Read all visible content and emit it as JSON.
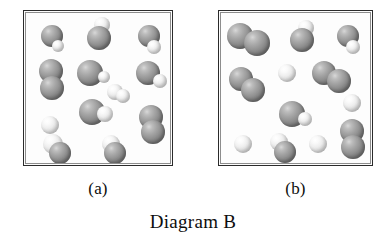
{
  "figure": {
    "caption": "Diagram B",
    "width": 386,
    "height": 248,
    "background_color": "#ffffff"
  },
  "legend": {
    "dark_atom_color": "#8f8f8f",
    "light_atom_color": "#ececec",
    "border_color": "#2b2b2b"
  },
  "panels": [
    {
      "id": "a",
      "label": "(a)",
      "box": {
        "x": 23,
        "y": 10,
        "width": 150,
        "height": 156
      },
      "molecule_count": 13,
      "molecules": [
        {
          "name": "dark-light-pair",
          "x": 28,
          "y": 28,
          "atoms": [
            {
              "type": "dark",
              "cx": 0,
              "cy": -3,
              "r": 11
            },
            {
              "type": "light",
              "cx": 6,
              "cy": 7,
              "r": 6
            }
          ]
        },
        {
          "name": "light-dark-pair",
          "x": 76,
          "y": 22,
          "atoms": [
            {
              "type": "light",
              "cx": 2,
              "cy": -8,
              "r": 8
            },
            {
              "type": "dark",
              "cx": -1,
              "cy": 5,
              "r": 12
            }
          ]
        },
        {
          "name": "dark-light-pair",
          "x": 125,
          "y": 28,
          "atoms": [
            {
              "type": "dark",
              "cx": 0,
              "cy": -3,
              "r": 11
            },
            {
              "type": "light",
              "cx": 5,
              "cy": 8,
              "r": 7
            }
          ]
        },
        {
          "name": "dark-dark-pair",
          "x": 27,
          "y": 68,
          "atoms": [
            {
              "type": "dark",
              "cx": 0,
              "cy": -8,
              "r": 12
            },
            {
              "type": "dark",
              "cx": 1,
              "cy": 9,
              "r": 12
            }
          ]
        },
        {
          "name": "dark-light-pair",
          "x": 68,
          "y": 62,
          "atoms": [
            {
              "type": "dark",
              "cx": -2,
              "cy": 0,
              "r": 13
            },
            {
              "type": "light",
              "cx": 12,
              "cy": 4,
              "r": 6
            }
          ]
        },
        {
          "name": "dark-light-pair",
          "x": 126,
          "y": 64,
          "atoms": [
            {
              "type": "dark",
              "cx": -2,
              "cy": -2,
              "r": 12
            },
            {
              "type": "light",
              "cx": 10,
              "cy": 6,
              "r": 7
            }
          ]
        },
        {
          "name": "light-light-pair",
          "x": 94,
          "y": 82,
          "atoms": [
            {
              "type": "light",
              "cx": -3,
              "cy": -1,
              "r": 8
            },
            {
              "type": "light",
              "cx": 5,
              "cy": 3,
              "r": 7
            }
          ]
        },
        {
          "name": "dark-light-pair",
          "x": 71,
          "y": 101,
          "atoms": [
            {
              "type": "dark",
              "cx": -3,
              "cy": 0,
              "r": 13
            },
            {
              "type": "light",
              "cx": 10,
              "cy": 2,
              "r": 8
            }
          ]
        },
        {
          "name": "light-atom",
          "x": 26,
          "y": 114,
          "atoms": [
            {
              "type": "light",
              "cx": 0,
              "cy": 0,
              "r": 9
            }
          ]
        },
        {
          "name": "dark-dark-pair",
          "x": 127,
          "y": 113,
          "atoms": [
            {
              "type": "dark",
              "cx": 0,
              "cy": -7,
              "r": 12
            },
            {
              "type": "dark",
              "cx": 2,
              "cy": 8,
              "r": 12
            }
          ]
        },
        {
          "name": "light-dark-pair",
          "x": 31,
          "y": 137,
          "atoms": [
            {
              "type": "light",
              "cx": -2,
              "cy": -4,
              "r": 10
            },
            {
              "type": "dark",
              "cx": 5,
              "cy": 5,
              "r": 11
            }
          ]
        },
        {
          "name": "light-dark-pair",
          "x": 88,
          "y": 137,
          "atoms": [
            {
              "type": "light",
              "cx": -1,
              "cy": -4,
              "r": 9
            },
            {
              "type": "dark",
              "cx": 3,
              "cy": 5,
              "r": 11
            }
          ]
        }
      ]
    },
    {
      "id": "b",
      "label": "(b)",
      "box": {
        "x": 218,
        "y": 10,
        "width": 155,
        "height": 156
      },
      "molecule_count": 12,
      "molecules": [
        {
          "name": "dark-dark-pair",
          "x": 30,
          "y": 28,
          "atoms": [
            {
              "type": "dark",
              "cx": -9,
              "cy": -3,
              "r": 13
            },
            {
              "type": "dark",
              "cx": 8,
              "cy": 4,
              "r": 13
            }
          ]
        },
        {
          "name": "light-dark-pair",
          "x": 84,
          "y": 26,
          "atoms": [
            {
              "type": "light",
              "cx": 3,
              "cy": -9,
              "r": 8
            },
            {
              "type": "dark",
              "cx": -1,
              "cy": 3,
              "r": 12
            }
          ]
        },
        {
          "name": "dark-light-pair",
          "x": 128,
          "y": 28,
          "atoms": [
            {
              "type": "dark",
              "cx": 1,
              "cy": -3,
              "r": 11
            },
            {
              "type": "light",
              "cx": 6,
              "cy": 8,
              "r": 7
            }
          ]
        },
        {
          "name": "light-atom",
          "x": 68,
          "y": 62,
          "atoms": [
            {
              "type": "light",
              "cx": 0,
              "cy": 0,
              "r": 9
            }
          ]
        },
        {
          "name": "dark-dark-pair",
          "x": 113,
          "y": 66,
          "atoms": [
            {
              "type": "dark",
              "cx": -8,
              "cy": -4,
              "r": 12
            },
            {
              "type": "dark",
              "cx": 7,
              "cy": 4,
              "r": 12
            }
          ]
        },
        {
          "name": "dark-dark-pair",
          "x": 28,
          "y": 74,
          "atoms": [
            {
              "type": "dark",
              "cx": -6,
              "cy": -6,
              "r": 12
            },
            {
              "type": "dark",
              "cx": 6,
              "cy": 5,
              "r": 12
            }
          ]
        },
        {
          "name": "light-atom",
          "x": 133,
          "y": 92,
          "atoms": [
            {
              "type": "light",
              "cx": 0,
              "cy": 0,
              "r": 9
            }
          ]
        },
        {
          "name": "dark-light-pair",
          "x": 76,
          "y": 104,
          "atoms": [
            {
              "type": "dark",
              "cx": -3,
              "cy": -1,
              "r": 13
            },
            {
              "type": "light",
              "cx": 10,
              "cy": 4,
              "r": 7
            }
          ]
        },
        {
          "name": "light-atom",
          "x": 24,
          "y": 133,
          "atoms": [
            {
              "type": "light",
              "cx": 0,
              "cy": 0,
              "r": 9
            }
          ]
        },
        {
          "name": "light-dark-pair",
          "x": 62,
          "y": 136,
          "atoms": [
            {
              "type": "light",
              "cx": -2,
              "cy": -5,
              "r": 9
            },
            {
              "type": "dark",
              "cx": 4,
              "cy": 5,
              "r": 11
            }
          ]
        },
        {
          "name": "light-atom",
          "x": 99,
          "y": 133,
          "atoms": [
            {
              "type": "light",
              "cx": 0,
              "cy": 0,
              "r": 9
            }
          ]
        },
        {
          "name": "dark-dark-pair",
          "x": 133,
          "y": 128,
          "atoms": [
            {
              "type": "dark",
              "cx": 0,
              "cy": -8,
              "r": 12
            },
            {
              "type": "dark",
              "cx": 1,
              "cy": 8,
              "r": 12
            }
          ]
        }
      ]
    }
  ],
  "chart_data": {
    "type": "diagram",
    "title": "Diagram B",
    "panels": [
      {
        "label": "(a)",
        "dark_dark_molecules": 2,
        "dark_light_molecules": 8,
        "light_light_molecules": 1,
        "lone_light_atoms": 1
      },
      {
        "label": "(b)",
        "dark_dark_molecules": 4,
        "dark_light_molecules": 4,
        "light_light_molecules": 0,
        "lone_light_atoms": 4
      }
    ]
  }
}
